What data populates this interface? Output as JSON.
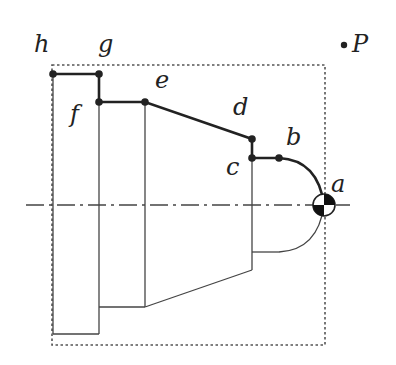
{
  "diagram": {
    "type": "turned-part-profile",
    "labels": {
      "a": "a",
      "b": "b",
      "c": "c",
      "d": "d",
      "e": "e",
      "f": "f",
      "g": "g",
      "h": "h",
      "P": "P"
    },
    "points": [
      {
        "id": "a",
        "x": 324,
        "y": 205
      },
      {
        "id": "b",
        "x": 279,
        "y": 158
      },
      {
        "id": "c",
        "x": 252,
        "y": 158
      },
      {
        "id": "d",
        "x": 252,
        "y": 139
      },
      {
        "id": "e",
        "x": 145,
        "y": 102
      },
      {
        "id": "f",
        "x": 99,
        "y": 102
      },
      {
        "id": "g",
        "x": 99,
        "y": 74
      },
      {
        "id": "h",
        "x": 53,
        "y": 74
      },
      {
        "id": "P",
        "x": 344,
        "y": 45
      }
    ],
    "colors": {
      "line": "#222222",
      "background": "#ffffff"
    }
  }
}
